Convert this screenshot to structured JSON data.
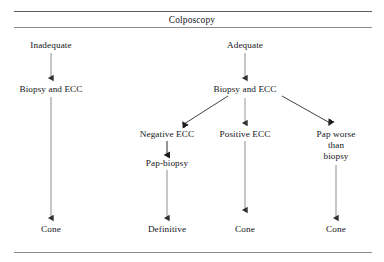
{
  "figure": {
    "title": "Colposcopy",
    "type": "clinical-management-flowchart",
    "nodes": {
      "inadequate": "Inadequate",
      "adequate": "Adequate",
      "biopsy_ecc_left": "Biopsy and ECC",
      "biopsy_ecc_right": "Biopsy and ECC",
      "negative_ecc": "Negative ECC",
      "positive_ecc": "Positive ECC",
      "pap_worse_line1": "Pap worse",
      "pap_worse_line2": "than",
      "pap_worse_line3": "biopsy",
      "pap_biopsy": "Pap-biopsy",
      "cone_left": "Cone",
      "definitive": "Definitive",
      "cone_middle": "Cone",
      "cone_right": "Cone"
    },
    "colors": {
      "rule": "#5b5b5b",
      "arrow_gray": "#8d8d8d",
      "arrow_dark": "#2b2b2b",
      "text": "#15151a",
      "background": "#ffffff"
    }
  }
}
